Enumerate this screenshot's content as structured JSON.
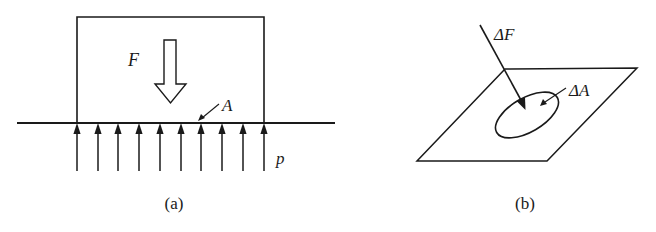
{
  "figure_a": {
    "caption": "(a)",
    "force_label": "F",
    "area_label": "A",
    "pressure_label": "p",
    "arrow_count": 10
  },
  "figure_b": {
    "caption": "(b)",
    "force_label": "ΔF",
    "area_label": "ΔA"
  },
  "colors": {
    "stroke": "#1a1a1a",
    "background": "#ffffff"
  }
}
